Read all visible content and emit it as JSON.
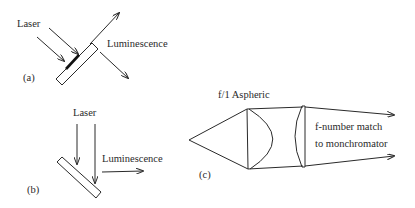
{
  "panels": {
    "a": {
      "tag": "(a)",
      "input_label": "Laser",
      "output_label": "Luminescence"
    },
    "b": {
      "tag": "(b)",
      "input_label": "Laser",
      "output_label": "Luminescence"
    },
    "c": {
      "tag": "(c)",
      "lens_label": "f/1  Aspheric",
      "output_label_line1": "f-number match",
      "output_label_line2": "to monchromator"
    }
  },
  "colors": {
    "ink": "#2a2a2a",
    "background": "#ffffff"
  }
}
